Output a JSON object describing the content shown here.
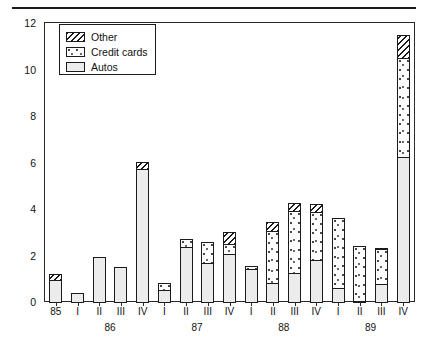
{
  "chart_data": {
    "type": "bar",
    "subtype": "stacked",
    "title": "",
    "xlabel": "",
    "ylabel": "$ Billions",
    "ylim": [
      0,
      12
    ],
    "yticks": [
      0,
      2,
      4,
      6,
      8,
      10,
      12
    ],
    "grid": false,
    "legend_position": "top-left inside plot",
    "categories": [
      "85",
      "I",
      "II",
      "III",
      "IV",
      "I",
      "II",
      "III",
      "IV",
      "I",
      "II",
      "III",
      "IV",
      "I",
      "II",
      "III",
      "IV"
    ],
    "group_labels": [
      {
        "label": "86",
        "span_start": 1,
        "span_end": 4
      },
      {
        "label": "87",
        "span_start": 5,
        "span_end": 8
      },
      {
        "label": "88",
        "span_start": 9,
        "span_end": 12
      },
      {
        "label": "89",
        "span_start": 13,
        "span_end": 16
      }
    ],
    "series": [
      {
        "name": "Autos",
        "fill": "light-gray-stipple",
        "values": [
          1.0,
          0.45,
          2.0,
          1.55,
          5.75,
          0.55,
          2.4,
          1.7,
          2.1,
          1.45,
          0.85,
          1.3,
          1.85,
          0.65,
          0.05,
          0.8,
          6.3
        ]
      },
      {
        "name": "Credit cards",
        "fill": "white-speckled",
        "values": [
          0.0,
          0.0,
          0.0,
          0.0,
          0.0,
          0.35,
          0.4,
          0.95,
          0.5,
          0.2,
          2.3,
          2.7,
          2.1,
          3.05,
          2.4,
          1.55,
          4.3
        ]
      },
      {
        "name": "Other",
        "fill": "diagonal-hatch",
        "values": [
          0.3,
          0.0,
          0.0,
          0.0,
          0.35,
          0.0,
          0.0,
          0.0,
          0.55,
          0.0,
          0.4,
          0.4,
          0.4,
          0.0,
          0.0,
          0.1,
          1.0
        ]
      }
    ],
    "totals": [
      1.3,
      0.45,
      2.0,
      1.55,
      6.1,
      0.9,
      2.8,
      2.65,
      3.15,
      1.65,
      3.55,
      4.4,
      4.35,
      3.7,
      2.45,
      2.45,
      11.6
    ]
  },
  "legend": {
    "items": [
      {
        "label": "Other",
        "swatch": "diagonal-hatch"
      },
      {
        "label": "Credit cards",
        "swatch": "white-speckled"
      },
      {
        "label": "Autos",
        "swatch": "light-gray-stipple"
      }
    ]
  },
  "colors": {
    "axis": "#2a2a2a",
    "ink": "#1b1b1b",
    "background": "#ffffff"
  }
}
